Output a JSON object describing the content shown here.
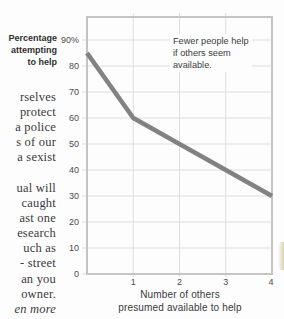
{
  "left_column": {
    "para1_lines": [
      "rselves",
      "protect",
      "a police",
      "s of our",
      "a sexist"
    ],
    "para2_lines": [
      "ual will",
      "caught",
      "ast one",
      "esearch",
      "uch as",
      "- street",
      "an you",
      "owner.",
      "en more"
    ]
  },
  "chart": {
    "y_axis_title_lines": [
      "Percentage",
      "attempting",
      "to help"
    ],
    "annotation_lines": [
      "Fewer people help",
      "if others seem",
      "available."
    ],
    "y_tick_labels": [
      "90%",
      "80",
      "70",
      "60",
      "50",
      "40",
      "30",
      "20",
      "10",
      "0"
    ],
    "x_tick_labels": [
      "1",
      "2",
      "3",
      "4"
    ],
    "x_axis_title_lines": [
      "Number of others",
      "presumed available to help"
    ]
  },
  "chart_data": {
    "type": "line",
    "x": [
      0,
      1,
      2,
      3,
      4
    ],
    "values": [
      85,
      60,
      50,
      40,
      30
    ],
    "title": "",
    "xlabel": "Number of others presumed available to help",
    "ylabel": "Percentage attempting to help",
    "annotation": "Fewer people help if others seem available.",
    "xlim": [
      0,
      4
    ],
    "ylim": [
      0,
      99
    ],
    "y_ticks": [
      0,
      10,
      20,
      30,
      40,
      50,
      60,
      70,
      80,
      90
    ],
    "x_ticks": [
      1,
      2,
      3,
      4
    ],
    "grid": true,
    "legend": false,
    "line_color": "#828282",
    "grid_color": "#dddddd",
    "frame_color": "#c4c4c4"
  }
}
